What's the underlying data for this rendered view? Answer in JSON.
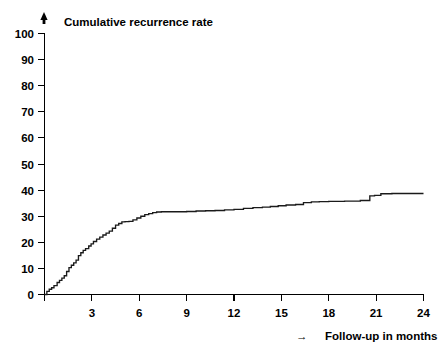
{
  "chart_data": {
    "type": "line",
    "title": "Cumulative recurrence rate",
    "xlabel": "Follow-up in months",
    "ylabel": "",
    "xlim": [
      0,
      24
    ],
    "ylim": [
      0,
      100
    ],
    "grid": false,
    "legend": null,
    "step_style": "post",
    "x_ticks": [
      0,
      3,
      6,
      9,
      12,
      15,
      18,
      21,
      24
    ],
    "x_tick_labels": [
      "",
      "3",
      "6",
      "9",
      "12",
      "15",
      "18",
      "21",
      "24"
    ],
    "y_ticks": [
      0,
      10,
      20,
      30,
      40,
      50,
      60,
      70,
      80,
      90,
      100
    ],
    "y_tick_labels": [
      "0",
      "10",
      "20",
      "30",
      "40",
      "50",
      "60",
      "70",
      "80",
      "90",
      "100"
    ],
    "x_axis_arrow": "→",
    "y_axis_arrow": "↑",
    "series": [
      {
        "name": "Cumulative recurrence rate",
        "color": "#1a1a1a",
        "x": [
          0.0,
          0.15,
          0.3,
          0.45,
          0.6,
          0.8,
          0.95,
          1.1,
          1.25,
          1.4,
          1.55,
          1.7,
          1.85,
          2.0,
          2.15,
          2.3,
          2.45,
          2.6,
          2.8,
          2.95,
          3.1,
          3.3,
          3.5,
          3.7,
          3.9,
          4.1,
          4.3,
          4.5,
          4.7,
          4.9,
          5.1,
          5.35,
          5.6,
          5.85,
          6.1,
          6.35,
          6.6,
          6.85,
          7.1,
          7.4,
          8.2,
          9.0,
          9.6,
          10.2,
          10.8,
          11.4,
          12.0,
          12.6,
          13.2,
          13.8,
          14.3,
          14.8,
          15.3,
          15.9,
          16.4,
          16.9,
          17.4,
          18.0,
          19.0,
          20.0,
          20.6,
          20.9,
          21.3,
          22.0,
          23.0,
          24.0
        ],
        "y": [
          0.0,
          1.2,
          2.0,
          2.6,
          3.4,
          4.6,
          5.4,
          6.3,
          7.2,
          8.8,
          10.3,
          11.2,
          12.1,
          13.2,
          14.9,
          16.0,
          16.9,
          17.6,
          18.6,
          19.4,
          20.3,
          21.2,
          22.0,
          22.8,
          23.5,
          24.3,
          25.4,
          26.6,
          27.2,
          27.8,
          27.9,
          28.0,
          28.6,
          29.3,
          30.0,
          30.6,
          31.0,
          31.4,
          31.6,
          31.7,
          31.7,
          31.8,
          32.0,
          32.1,
          32.2,
          32.4,
          32.6,
          33.0,
          33.3,
          33.5,
          33.7,
          34.0,
          34.3,
          34.5,
          35.2,
          35.5,
          35.6,
          35.7,
          35.8,
          36.0,
          37.8,
          38.0,
          38.6,
          38.7,
          38.7,
          38.7
        ]
      }
    ]
  },
  "figure": {
    "title": "Cumulative recurrence rate",
    "x_caption": "Follow-up in months",
    "x_caption_arrow": "→"
  }
}
